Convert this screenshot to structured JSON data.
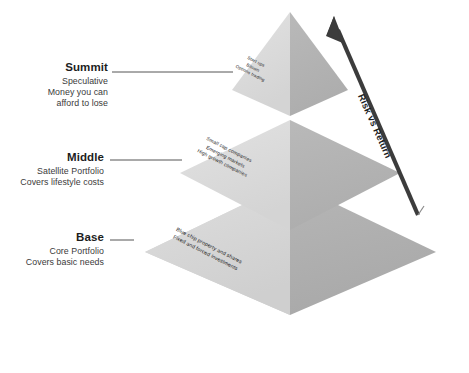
{
  "diagram": {
    "colors": {
      "left_face": "#d2d2d2",
      "right_face": "#b0b0b0",
      "left_face_top": "#dcdcdc",
      "right_face_top": "#a8a8a8",
      "arrow": "#3c3c3c",
      "text": "#2b2b2b",
      "background": "#ffffff"
    },
    "arrow": {
      "label": "Risk vs Return",
      "direction": "up-right",
      "icon": "arrow-up-right-icon"
    },
    "tiers": [
      {
        "id": "summit",
        "label": "Summit",
        "description_lines": [
          "Speculative",
          "Money you can",
          "afford to lose"
        ],
        "contents": [
          "Start ups",
          "Bitcoin",
          "Options trading"
        ]
      },
      {
        "id": "middle",
        "label": "Middle",
        "description_lines": [
          "Satellite Portfolio",
          "Covers lifestyle costs"
        ],
        "contents": [
          "Small cap companies",
          "Emerging markets",
          "High growth companies"
        ]
      },
      {
        "id": "base",
        "label": "Base",
        "description_lines": [
          "Core Portfolio",
          "Covers basic needs"
        ],
        "contents": [
          "Blue chip property and shares",
          "Fixed and forced investments"
        ]
      }
    ]
  }
}
